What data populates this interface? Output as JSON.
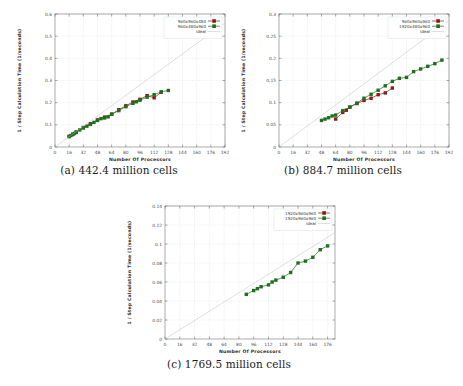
{
  "figure": {
    "background": "#ffffff",
    "colors": {
      "series_red": "#8c1b13",
      "series_green": "#1f6f1f",
      "ideal_line": "#b8b8b8",
      "grid": "#c8d4e0",
      "axis": "#5a5a5a",
      "text": "#3a3a3a"
    }
  },
  "panels": [
    {
      "id": "a",
      "caption": "(a) 442.4 million cells",
      "chart_data": {
        "type": "line",
        "title": "",
        "xlabel": "Number Of Processors",
        "ylabel": "1 / Step Calculation Time (1/seconds)",
        "xlim": [
          0,
          192
        ],
        "ylim": [
          0,
          0.6
        ],
        "xticks": [
          0,
          16,
          32,
          48,
          64,
          80,
          96,
          112,
          128,
          144,
          160,
          176,
          192
        ],
        "yticks": [
          0,
          0.1,
          0.2,
          0.3,
          0.4,
          0.5,
          0.6
        ],
        "grid": true,
        "legend_position": "top-right",
        "series": [
          {
            "name": "960x960x480",
            "color": "#8c1b13",
            "marker": "square",
            "x": [
              16,
              20,
              24,
              32,
              40,
              48,
              56,
              64,
              72,
              80,
              88,
              96,
              104,
              112,
              120
            ],
            "y": [
              0.048,
              0.058,
              0.068,
              0.088,
              0.105,
              0.122,
              0.135,
              0.148,
              0.168,
              0.186,
              0.203,
              0.215,
              0.232,
              0.222,
              0.247
            ]
          },
          {
            "name": "960x480x960",
            "color": "#1f6f1f",
            "marker": "square",
            "x": [
              16,
              18,
              20,
              22,
              24,
              28,
              32,
              36,
              40,
              44,
              48,
              52,
              56,
              60,
              64,
              72,
              80,
              88,
              92,
              96,
              104,
              112,
              120,
              128
            ],
            "y": [
              0.047,
              0.052,
              0.056,
              0.061,
              0.066,
              0.077,
              0.086,
              0.094,
              0.102,
              0.111,
              0.12,
              0.128,
              0.131,
              0.136,
              0.148,
              0.164,
              0.182,
              0.197,
              0.204,
              0.211,
              0.225,
              0.236,
              0.249,
              0.255
            ]
          },
          {
            "name": "ideal",
            "color": "#b8b8b8",
            "marker": "none",
            "x": [
              0,
              192
            ],
            "y": [
              0,
              0.56
            ]
          }
        ]
      }
    },
    {
      "id": "b",
      "caption": "(b) 884.7 million cells",
      "chart_data": {
        "type": "line",
        "title": "",
        "xlabel": "Number Of Processors",
        "ylabel": "1 / Step Calculation Time (1/seconds)",
        "xlim": [
          0,
          192
        ],
        "ylim": [
          0,
          0.3
        ],
        "xticks": [
          0,
          16,
          32,
          48,
          64,
          80,
          96,
          112,
          128,
          144,
          160,
          176,
          192
        ],
        "yticks": [
          0,
          0.05,
          0.1,
          0.15,
          0.2,
          0.25,
          0.3
        ],
        "grid": true,
        "legend_position": "top-right",
        "series": [
          {
            "name": "960x960x960",
            "color": "#8c1b13",
            "marker": "square",
            "x": [
              64,
              72,
              76,
              80,
              88,
              96,
              104,
              112,
              120,
              128
            ],
            "y": [
              0.063,
              0.078,
              0.083,
              0.09,
              0.098,
              0.105,
              0.11,
              0.118,
              0.122,
              0.133
            ]
          },
          {
            "name": "1920x480x960",
            "color": "#1f6f1f",
            "marker": "square",
            "x": [
              48,
              52,
              56,
              60,
              64,
              72,
              80,
              88,
              96,
              104,
              112,
              120,
              128,
              136,
              144,
              152,
              160,
              168,
              176,
              184
            ],
            "y": [
              0.06,
              0.063,
              0.066,
              0.07,
              0.072,
              0.082,
              0.09,
              0.099,
              0.11,
              0.119,
              0.128,
              0.138,
              0.148,
              0.155,
              0.157,
              0.17,
              0.176,
              0.182,
              0.188,
              0.196
            ]
          },
          {
            "name": "ideal",
            "color": "#b8b8b8",
            "marker": "none",
            "x": [
              0,
              192
            ],
            "y": [
              0,
              0.285
            ]
          }
        ]
      }
    },
    {
      "id": "c",
      "caption": "(c) 1769.5 million cells",
      "chart_data": {
        "type": "line",
        "title": "",
        "xlabel": "Number Of Processors",
        "ylabel": "1 / Step Calculation Time (1/seconds)",
        "xlim": [
          0,
          184
        ],
        "ylim": [
          0,
          0.14
        ],
        "xticks": [
          0,
          16,
          32,
          48,
          64,
          80,
          96,
          112,
          128,
          144,
          160,
          176
        ],
        "yticks": [
          0,
          0.02,
          0.04,
          0.06,
          0.08,
          0.1,
          0.12,
          0.14
        ],
        "grid": true,
        "legend_position": "top-right",
        "series": [
          {
            "name": "1920x960x960",
            "color": "#8c1b13",
            "marker": "square",
            "x": [],
            "y": []
          },
          {
            "name": "1920x960x960",
            "color": "#1f6f1f",
            "marker": "square",
            "x": [
              88,
              96,
              100,
              104,
              112,
              116,
              120,
              128,
              136,
              144,
              152,
              160,
              168,
              176
            ],
            "y": [
              0.047,
              0.051,
              0.053,
              0.055,
              0.057,
              0.06,
              0.062,
              0.065,
              0.07,
              0.08,
              0.082,
              0.086,
              0.094,
              0.098
            ]
          },
          {
            "name": "ideal",
            "color": "#b8b8b8",
            "marker": "none",
            "x": [
              0,
              184
            ],
            "y": [
              0,
              0.112
            ]
          }
        ]
      }
    }
  ]
}
